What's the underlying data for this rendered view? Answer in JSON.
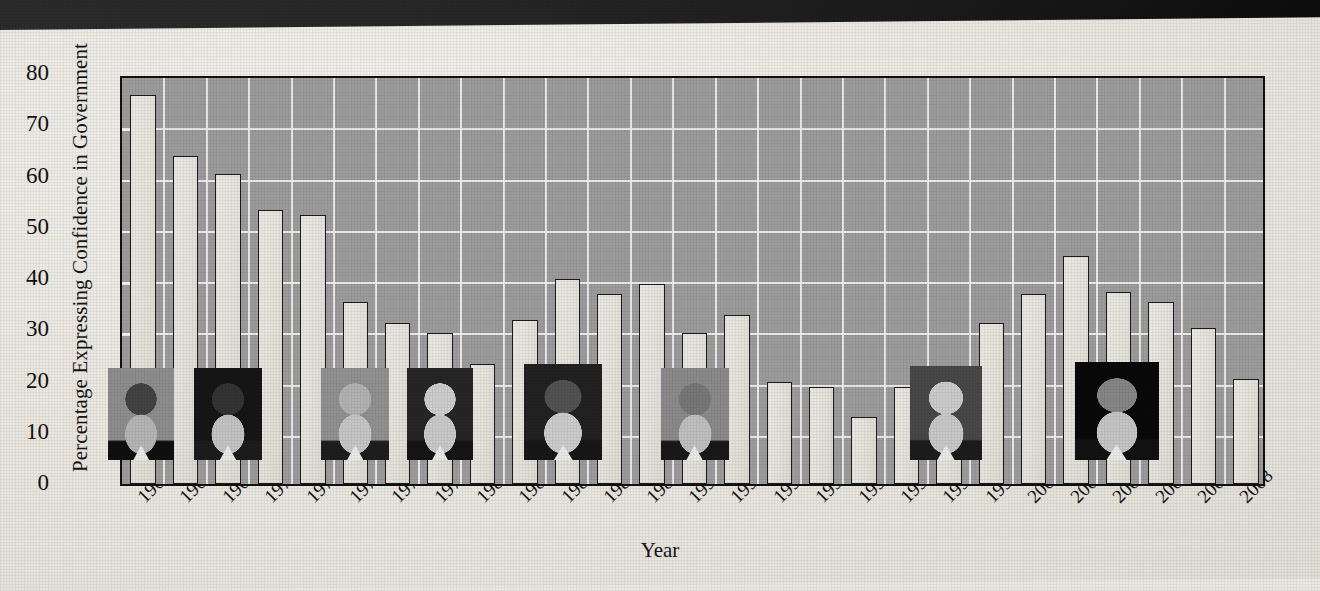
{
  "figure": {
    "colors": {
      "plot_bg": "#9d9d9d",
      "bar_fill": "#e8e5de",
      "bar_stroke": "#1b1b1b",
      "grid": "#f2f2f2",
      "paper": "#edeae3",
      "scan_band": "#1a1a1a"
    }
  },
  "chart_data": {
    "type": "bar",
    "title": "",
    "xlabel": "Year",
    "ylabel": "Percentage Expressing Confidence in Government",
    "ylim": [
      0,
      80
    ],
    "yticks": [
      0,
      10,
      20,
      30,
      40,
      50,
      60,
      70,
      80
    ],
    "grid": true,
    "legend": "none",
    "categories": [
      "1964",
      "1966",
      "1968",
      "1970",
      "1972",
      "1974",
      "1976",
      "1978",
      "1980",
      "1982",
      "1984",
      "1986",
      "1988",
      "1990",
      "1991",
      "1992",
      "1993",
      "1994",
      "1995",
      "1996",
      "1998",
      "2000",
      "2001",
      "2002",
      "2004",
      "2006",
      "2008"
    ],
    "values": [
      76,
      64,
      60.5,
      53.5,
      52.5,
      35.5,
      31.5,
      29.5,
      23.5,
      32,
      40,
      37,
      39,
      29.5,
      33,
      20,
      19,
      13,
      19,
      22.5,
      31.5,
      37,
      44.5,
      37.5,
      35.5,
      30.5,
      20.5
    ],
    "series": [
      {
        "name": "Percentage Expressing Confidence in Government",
        "values": [
          76,
          64,
          60.5,
          53.5,
          52.5,
          35.5,
          31.5,
          29.5,
          23.5,
          32,
          40,
          37,
          39,
          29.5,
          33,
          20,
          19,
          13,
          19,
          22.5,
          31.5,
          37,
          44.5,
          37.5,
          35.5,
          30.5,
          20.5
        ]
      }
    ],
    "annotations": [
      {
        "name": "photo-lyndon-johnson",
        "label": "Lyndon B. Johnson",
        "near_category": "1964"
      },
      {
        "name": "photo-richard-nixon",
        "label": "Richard Nixon",
        "near_category": "1968"
      },
      {
        "name": "photo-gerald-ford",
        "label": "Gerald Ford",
        "near_category": "1974"
      },
      {
        "name": "photo-jimmy-carter",
        "label": "Jimmy Carter",
        "near_category": "1978"
      },
      {
        "name": "photo-ronald-reagan",
        "label": "Ronald Reagan",
        "near_category": "1984"
      },
      {
        "name": "photo-george-h-w-bush",
        "label": "George H. W. Bush",
        "near_category": "1990"
      },
      {
        "name": "photo-bill-clinton",
        "label": "Bill Clinton",
        "near_category": "1996"
      },
      {
        "name": "photo-george-w-bush",
        "label": "George W. Bush",
        "near_category": "2002"
      }
    ]
  }
}
